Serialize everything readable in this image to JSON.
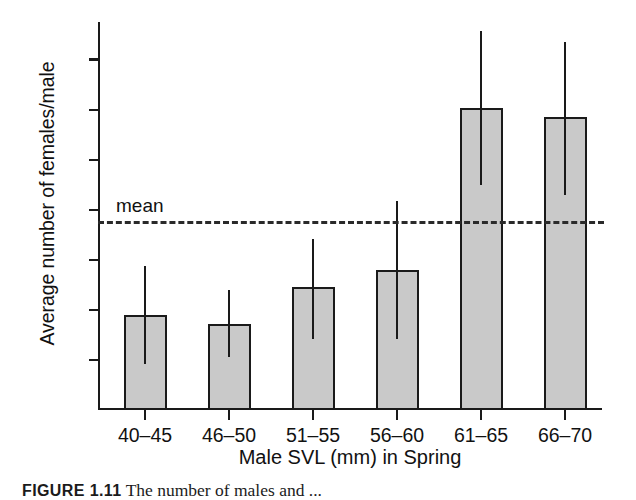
{
  "chart_data": {
    "type": "bar",
    "title": "",
    "xlabel": "Male SVL (mm) in Spring",
    "ylabel": "Average number of females/male",
    "categories": [
      "40–45",
      "46–50",
      "51–55",
      "56–60",
      "61–65",
      "66–70"
    ],
    "values": [
      3.8,
      3.45,
      4.9,
      5.6,
      12.05,
      11.7
    ],
    "error_low": [
      1.85,
      2.1,
      2.85,
      2.85,
      9.0,
      8.6
    ],
    "error_high": [
      5.75,
      4.8,
      6.85,
      8.35,
      15.15,
      14.7
    ],
    "ylim": [
      0,
      15.5
    ],
    "yticks": [
      2,
      4,
      6,
      8,
      10,
      12,
      14
    ],
    "ytick_labels": [
      "2",
      "4",
      "6",
      "8",
      "10",
      "12",
      "14"
    ],
    "grid": false,
    "legend": "none",
    "annotations": [
      {
        "name": "mean-line",
        "label": "mean",
        "value": 7.55,
        "style": "dashed-horizontal"
      }
    ],
    "bar_fill": "#c9c9c9",
    "bar_edge": "#1a1a1a",
    "axis_color": "#1a1a1a",
    "error_bar_color": "#1a1a1a",
    "error_bar_caps": false
  },
  "caption": {
    "figure_number": "FIGURE 1.11",
    "text": "The number of males and ... "
  }
}
